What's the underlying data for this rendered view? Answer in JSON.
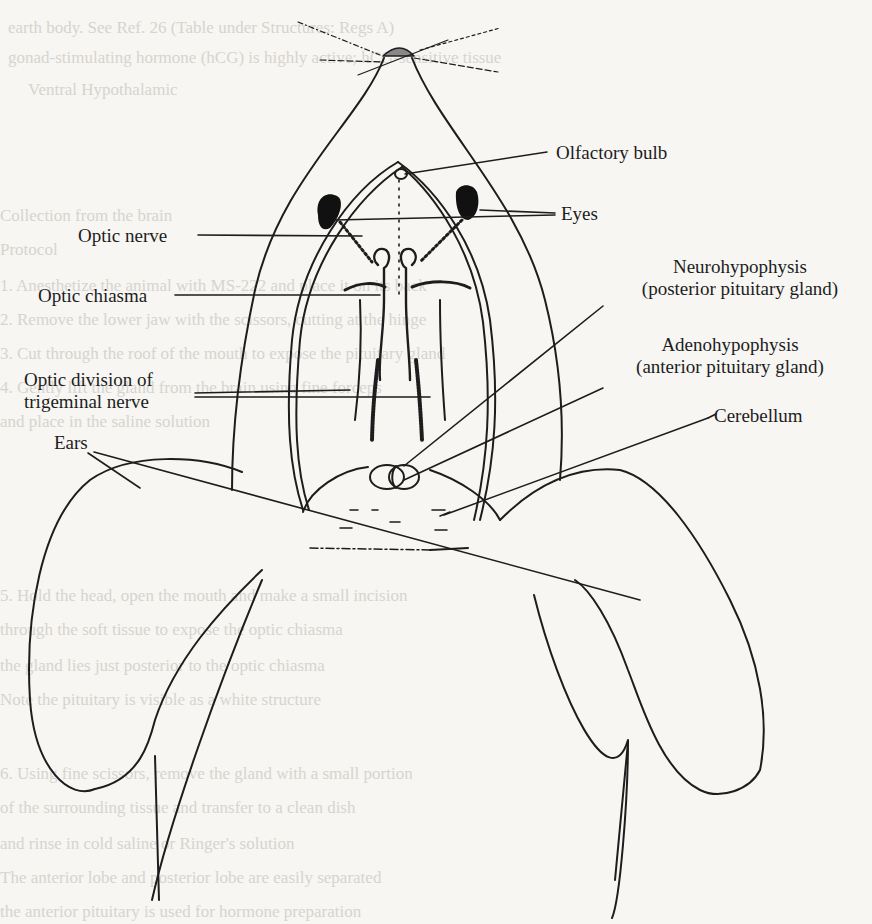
{
  "figure": {
    "labels": {
      "olfactory_bulb": "Olfactory bulb",
      "eyes": "Eyes",
      "optic_nerve": "Optic nerve",
      "optic_chiasma": "Optic chiasma",
      "neurohypophysis_line1": "Neurohypophysis",
      "neurohypophysis_line2": "(posterior pituitary gland)",
      "adenohypophysis_line1": "Adenohypophysis",
      "adenohypophysis_line2": "(anterior pituitary gland)",
      "optic_division_line1": "Optic division of",
      "optic_division_line2": "trigeminal nerve",
      "cerebellum": "Cerebellum",
      "ears": "Ears"
    },
    "colors": {
      "ink": "#1d1d1d",
      "paper": "#f7f6f3",
      "bleed_through": "#d6d4cf"
    }
  },
  "background_text": {
    "lines": [
      "earth body. See Ref. 26 (Table under Structures: Regs A)",
      "gonad-stimulating hormone (hCG) is highly active; hCG-sensitive tissue",
      "Ventral Hypothalamic",
      "Collection from the brain",
      "Protocol",
      "1. Anesthetize the animal with MS-222 and place it on its back",
      "2. Remove the lower jaw with the scissors, cutting at the hinge",
      "3. Cut through the roof of the mouth to expose the pituitary gland",
      "4. Gently lift the gland from the brain using fine forceps",
      "   and place in the saline solution",
      "5. Hold the head, open the mouth and make a small incision",
      "   through the soft tissue to expose the optic chiasma",
      "   the gland lies just posterior to the optic chiasma",
      "   Note the pituitary is visible as a white structure",
      "6. Using fine scissors, remove the gland with a small portion",
      "   of the surrounding tissue and transfer to a clean dish",
      "   and rinse in cold saline or Ringer's solution",
      "   The anterior lobe and posterior lobe are easily separated",
      "   the anterior pituitary is used for hormone preparation"
    ]
  }
}
